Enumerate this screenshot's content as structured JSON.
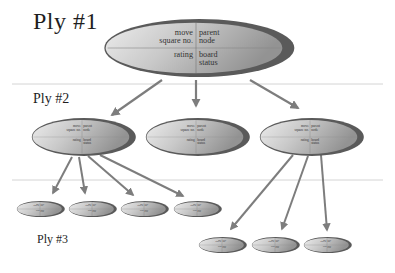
{
  "plies": [
    {
      "label": "Ply  #1"
    },
    {
      "label": "Ply  #2"
    },
    {
      "label": "Ply  #3"
    }
  ],
  "node_fields": {
    "top_left": [
      "move",
      "square no."
    ],
    "top_right": [
      "parent",
      "node"
    ],
    "bottom_left": [
      "rating"
    ],
    "bottom_right": [
      "board",
      "status"
    ]
  },
  "tree": {
    "ply1_nodes": 1,
    "ply2_nodes": 3,
    "ply3_groups": [
      {
        "parent_index": 0,
        "children": 4
      },
      {
        "parent_index": 2,
        "children": 3
      }
    ]
  },
  "colors": {
    "ellipse_border": "#5a5a5a",
    "ellipse_fill_light": "#e6e6e6",
    "ellipse_fill_dark": "#9a9a9a",
    "arrow": "#7d7d7d",
    "divider": "#d4d4d4",
    "text": "#333333"
  }
}
